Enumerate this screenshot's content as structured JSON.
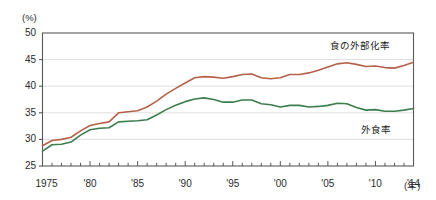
{
  "chart_data": {
    "type": "line",
    "title": "",
    "xlabel": "(年)",
    "ylabel": "(%)",
    "ylim": [
      25,
      50
    ],
    "xlim": [
      1975,
      2014
    ],
    "yticks": [
      25,
      30,
      35,
      40,
      45,
      50
    ],
    "ytick_labels": [
      "25",
      "30",
      "35",
      "40",
      "45",
      "50"
    ],
    "xticks": [
      1975,
      1980,
      1985,
      1990,
      1995,
      2000,
      2005,
      2010,
      2014
    ],
    "xtick_labels": [
      "1975",
      "'80",
      "'85",
      "'90",
      "'95",
      "'00",
      "'05",
      "'10",
      "'14"
    ],
    "grid": true,
    "grid_axis": "y",
    "legend_position": "inline-right",
    "x": [
      1975,
      1976,
      1977,
      1978,
      1979,
      1980,
      1981,
      1982,
      1983,
      1984,
      1985,
      1986,
      1987,
      1988,
      1989,
      1990,
      1991,
      1992,
      1993,
      1994,
      1995,
      1996,
      1997,
      1998,
      1999,
      2000,
      2001,
      2002,
      2003,
      2004,
      2005,
      2006,
      2007,
      2008,
      2009,
      2010,
      2011,
      2012,
      2013,
      2014
    ],
    "series": [
      {
        "name": "食の外部化率",
        "color": "#b5614a",
        "values": [
          28.8,
          29.8,
          30.0,
          30.4,
          31.6,
          32.6,
          33.0,
          33.3,
          35.0,
          35.2,
          35.4,
          36.1,
          37.2,
          38.5,
          39.6,
          40.6,
          41.6,
          41.8,
          41.7,
          41.5,
          41.8,
          42.2,
          42.3,
          41.6,
          41.4,
          41.6,
          42.2,
          42.2,
          42.5,
          43.0,
          43.6,
          44.2,
          44.4,
          44.1,
          43.7,
          43.8,
          43.5,
          43.4,
          43.9,
          44.5
        ]
      },
      {
        "name": "外食率",
        "color": "#3d7d4e",
        "values": [
          27.8,
          29.0,
          29.1,
          29.5,
          30.8,
          31.8,
          32.1,
          32.2,
          33.3,
          33.4,
          33.5,
          33.7,
          34.6,
          35.6,
          36.4,
          37.1,
          37.6,
          37.8,
          37.5,
          37.0,
          37.0,
          37.4,
          37.4,
          36.7,
          36.5,
          36.1,
          36.4,
          36.4,
          36.1,
          36.2,
          36.4,
          36.8,
          36.7,
          36.0,
          35.5,
          35.6,
          35.3,
          35.3,
          35.5,
          35.8
        ]
      }
    ]
  },
  "axes": {
    "y_unit": "(%)",
    "x_unit": "(年)"
  }
}
